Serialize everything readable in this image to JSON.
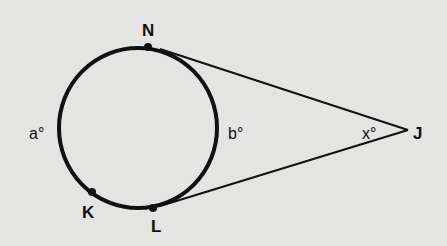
{
  "diagram": {
    "type": "circle-with-two-tangents",
    "background": "#e4e4e2",
    "stroke_color": "#111111",
    "circle": {
      "cx": 138,
      "cy": 128,
      "r": 80
    },
    "points": {
      "N": {
        "label": "N",
        "x": 148,
        "y": 47
      },
      "K": {
        "label": "K",
        "x": 92,
        "y": 192
      },
      "L": {
        "label": "L",
        "x": 153,
        "y": 208
      },
      "J": {
        "label": "J",
        "x": 408,
        "y": 130
      }
    },
    "arc_labels": {
      "a": "a°",
      "b": "b°"
    },
    "angle_label": {
      "x": "x°"
    },
    "segments": [
      {
        "from": "N",
        "to": "J",
        "kind": "tangent"
      },
      {
        "from": "L",
        "to": "J",
        "kind": "tangent"
      }
    ]
  }
}
